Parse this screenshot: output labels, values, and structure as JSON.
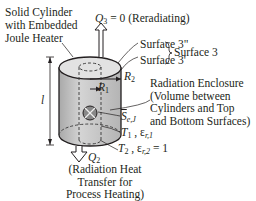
{
  "heater_label": [
    "Solid Cylinder",
    "with Embedded",
    "Joule Heater"
  ],
  "q3": {
    "symbol": "Q",
    "sub": "3",
    "value": "= 0",
    "note": "(Reradiating)"
  },
  "surfaces": {
    "s3pp": "Surface 3\"",
    "s3p": "Surface 3'",
    "group": "Surface 3"
  },
  "r2": {
    "symbol": "R",
    "sub": "2"
  },
  "r1": {
    "symbol": "R",
    "sub": "1"
  },
  "length_symbol": "l",
  "enclosure_label": [
    "Radiation Enclosure",
    "(Volume between",
    "Cylinders and Top",
    "and Bottom Surfaces)"
  ],
  "source": {
    "symbol": "S",
    "sub": "e,J"
  },
  "t1": {
    "symbol": "T",
    "sub": "1",
    "sep": ",",
    "eps": "ε",
    "eps_sub": "r,1"
  },
  "t2": {
    "symbol": "T",
    "sub": "2",
    "sep": ",",
    "eps": "ε",
    "eps_sub": "r,2",
    "value": "= 1"
  },
  "q2": {
    "symbol": "Q",
    "sub": "2"
  },
  "q2_label": [
    "(Radiation Heat",
    "Transfer for",
    "Process Heating)"
  ],
  "colors": {
    "cylinder_fill": "#c9c9c9",
    "top_fill": "#e3e3e3",
    "line": "#231f20"
  }
}
